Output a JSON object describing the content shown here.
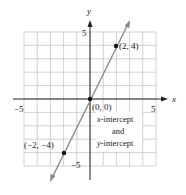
{
  "chart_data": {
    "type": "line",
    "title": "",
    "xlabel": "x",
    "ylabel": "y",
    "xlim": [
      -5,
      5
    ],
    "ylim": [
      -5,
      5
    ],
    "grid": true,
    "x_ticks_labeled": [
      "−5",
      "5"
    ],
    "y_ticks_labeled": [
      "5",
      "−5"
    ],
    "series": [
      {
        "name": "y = 2x",
        "x": [
          -2,
          0,
          2
        ],
        "y": [
          -4,
          0,
          4
        ],
        "color": "#8a8a8a"
      }
    ],
    "points": [
      {
        "x": 2,
        "y": 4,
        "label": "(2, 4)"
      },
      {
        "x": 0,
        "y": 0,
        "label": "(0, 0)"
      },
      {
        "x": -2,
        "y": -4,
        "label": "(−2, −4)"
      }
    ],
    "annotations": [
      "x-intercept",
      "and",
      "y-intercept"
    ]
  },
  "labels": {
    "x_axis": "x",
    "y_axis": "y",
    "x_tick_neg": "−5",
    "x_tick_pos": "5",
    "y_tick_pos": "5",
    "y_tick_neg": "−5",
    "pt_2_4": "(2, 4)",
    "pt_origin": "(0, 0)",
    "pt_neg": "(−2, −4)",
    "ann_line1_italic": "x",
    "ann_line1_rest": "-intercept",
    "ann_line2": "and",
    "ann_line3_italic": "y",
    "ann_line3_rest": "-intercept"
  },
  "colors": {
    "grid": "#c8c8c8",
    "axis": "#222222",
    "line": "#8a8a8a",
    "point": "#111111"
  }
}
